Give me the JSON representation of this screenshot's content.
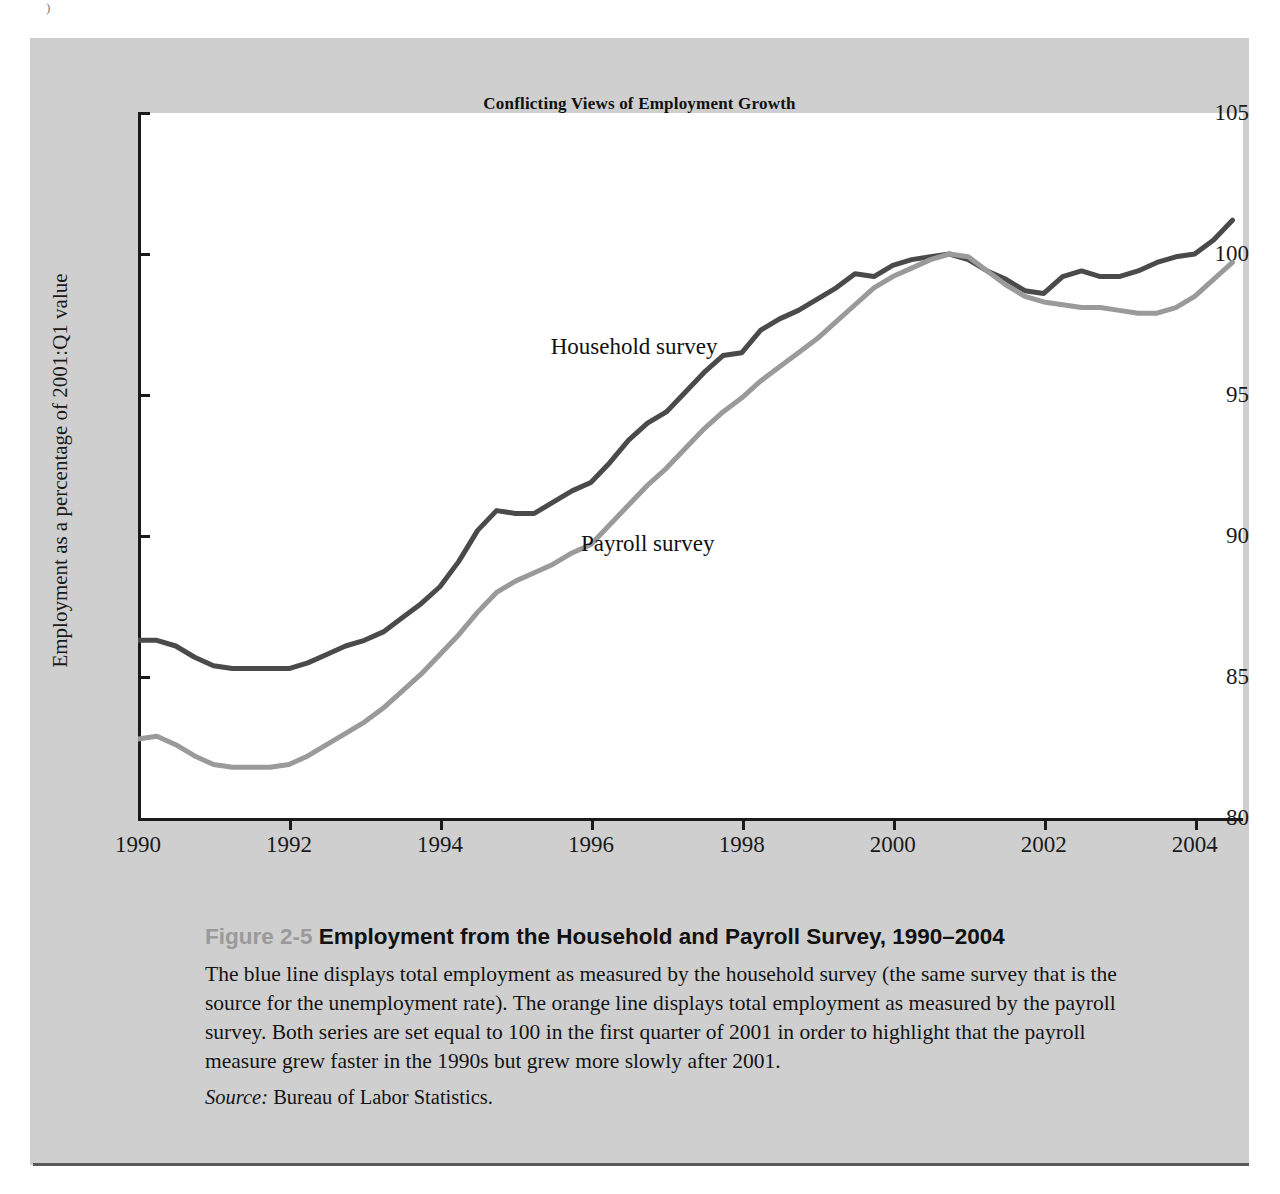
{
  "page": {
    "crumb": ")"
  },
  "figure": {
    "chart_title": "Conflicting Views of Employment Growth",
    "caption_figure_number": "Figure 2-5",
    "caption_title": "Employment from the Household and Payroll Survey, 1990–2004",
    "caption_body": "The blue line displays total employment as measured by the household survey (the same survey that is the source for the unemployment rate). The orange line displays total employment as measured by the payroll survey. Both series are set equal to 100 in the first quarter of 2001 in order to highlight that the payroll measure grew faster in the 1990s but grew more slowly after 2001.",
    "caption_source_label": "Source:",
    "caption_source_value": "Bureau of Labor Statistics."
  },
  "colors": {
    "household_line": "#4a4a4a",
    "payroll_line": "#9a9a9a",
    "panel_background": "#cfcfcf",
    "plot_background": "#ffffff",
    "axis": "#1a1a1a",
    "figure_number": "#9a9a9a"
  },
  "chart_data": {
    "type": "line",
    "title": "Conflicting Views of Employment Growth",
    "xlabel": "",
    "ylabel": "Employment as a percentage of 2001:Q1 value",
    "xlim": [
      1990,
      2004.6
    ],
    "ylim": [
      80,
      105
    ],
    "xticks": [
      1990,
      1992,
      1994,
      1996,
      1998,
      2000,
      2002,
      2004
    ],
    "yticks": [
      80,
      85,
      90,
      95,
      100,
      105
    ],
    "grid": false,
    "legend": "inline-labels",
    "series": [
      {
        "name": "Household survey",
        "color": "#4a4a4a",
        "label_position": {
          "x": 1995.6,
          "y": 96.6
        },
        "x": [
          1990.0,
          1990.25,
          1990.5,
          1990.75,
          1991.0,
          1991.25,
          1991.5,
          1991.75,
          1992.0,
          1992.25,
          1992.5,
          1992.75,
          1993.0,
          1993.25,
          1993.5,
          1993.75,
          1994.0,
          1994.25,
          1994.5,
          1994.75,
          1995.0,
          1995.25,
          1995.5,
          1995.75,
          1996.0,
          1996.25,
          1996.5,
          1996.75,
          1997.0,
          1997.25,
          1997.5,
          1997.75,
          1998.0,
          1998.25,
          1998.5,
          1998.75,
          1999.0,
          1999.25,
          1999.5,
          1999.75,
          2000.0,
          2000.25,
          2000.5,
          2000.75,
          2001.0,
          2001.25,
          2001.5,
          2001.75,
          2002.0,
          2002.25,
          2002.5,
          2002.75,
          2003.0,
          2003.25,
          2003.5,
          2003.75,
          2004.0,
          2004.25,
          2004.5
        ],
        "y": [
          86.3,
          86.3,
          86.1,
          85.7,
          85.4,
          85.3,
          85.3,
          85.3,
          85.3,
          85.5,
          85.8,
          86.1,
          86.3,
          86.6,
          87.1,
          87.6,
          88.2,
          89.1,
          90.2,
          90.9,
          90.8,
          90.8,
          91.2,
          91.6,
          91.9,
          92.6,
          93.4,
          94.0,
          94.4,
          95.1,
          95.8,
          96.4,
          96.5,
          97.3,
          97.7,
          98.0,
          98.4,
          98.8,
          99.3,
          99.2,
          99.6,
          99.8,
          99.9,
          100.0,
          99.8,
          99.4,
          99.1,
          98.7,
          98.6,
          99.2,
          99.4,
          99.2,
          99.2,
          99.4,
          99.7,
          99.9,
          100.0,
          100.5,
          101.2
        ]
      },
      {
        "name": "Payroll survey",
        "color": "#9a9a9a",
        "label_position": {
          "x": 1996.0,
          "y": 89.6
        },
        "x": [
          1990.0,
          1990.25,
          1990.5,
          1990.75,
          1991.0,
          1991.25,
          1991.5,
          1991.75,
          1992.0,
          1992.25,
          1992.5,
          1992.75,
          1993.0,
          1993.25,
          1993.5,
          1993.75,
          1994.0,
          1994.25,
          1994.5,
          1994.75,
          1995.0,
          1995.25,
          1995.5,
          1995.75,
          1996.0,
          1996.25,
          1996.5,
          1996.75,
          1997.0,
          1997.25,
          1997.5,
          1997.75,
          1998.0,
          1998.25,
          1998.5,
          1998.75,
          1999.0,
          1999.25,
          1999.5,
          1999.75,
          2000.0,
          2000.25,
          2000.5,
          2000.75,
          2001.0,
          2001.25,
          2001.5,
          2001.75,
          2002.0,
          2002.25,
          2002.5,
          2002.75,
          2003.0,
          2003.25,
          2003.5,
          2003.75,
          2004.0,
          2004.25,
          2004.5
        ],
        "y": [
          82.8,
          82.9,
          82.6,
          82.2,
          81.9,
          81.8,
          81.8,
          81.8,
          81.9,
          82.2,
          82.6,
          83.0,
          83.4,
          83.9,
          84.5,
          85.1,
          85.8,
          86.5,
          87.3,
          88.0,
          88.4,
          88.7,
          89.0,
          89.4,
          89.7,
          90.4,
          91.1,
          91.8,
          92.4,
          93.1,
          93.8,
          94.4,
          94.9,
          95.5,
          96.0,
          96.5,
          97.0,
          97.6,
          98.2,
          98.8,
          99.2,
          99.5,
          99.8,
          100.0,
          99.9,
          99.4,
          98.9,
          98.5,
          98.3,
          98.2,
          98.1,
          98.1,
          98.0,
          97.9,
          97.9,
          98.1,
          98.5,
          99.1,
          99.7
        ]
      }
    ]
  }
}
